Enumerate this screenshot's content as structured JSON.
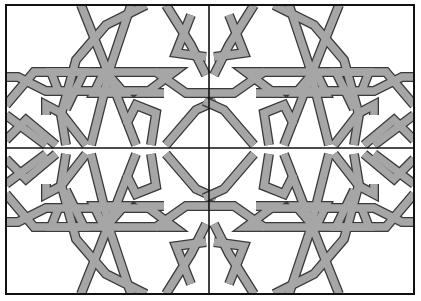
{
  "figure": {
    "frame": {
      "x": 6,
      "y": 5,
      "width": 408,
      "height": 289
    },
    "dividers": {
      "vertical_x": 209,
      "horizontal_y": 148
    },
    "quadrants": [
      "top-left",
      "top-right",
      "bottom-left",
      "bottom-right"
    ],
    "colors": {
      "background": "#ffffff",
      "band_fill": "#a6a6a6",
      "band_outline": "#3a3a3a",
      "frame": "#111111"
    }
  }
}
